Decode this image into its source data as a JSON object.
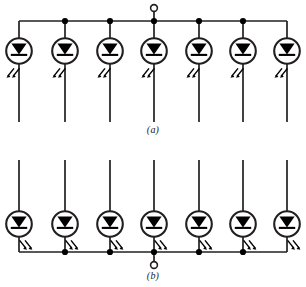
{
  "figure": {
    "width": 306,
    "height": 287,
    "background_color": "#ffffff",
    "line_color": "#231f20",
    "fill_color": "#000000"
  },
  "captions": {
    "a": "(a)",
    "b": "(b)"
  },
  "panels": [
    {
      "id": "a",
      "name": "common-anode-array",
      "caption": "(a)",
      "bus_position": "top",
      "bus_y": 21,
      "terminal": {
        "type": "open-circle",
        "x": 154,
        "y": 8,
        "radius": 3.4
      },
      "terminal_label": "",
      "led_count": 7,
      "led_center_y": 51,
      "led_radius": 13,
      "column_x": [
        19,
        65,
        110,
        154,
        199,
        243,
        287
      ],
      "junction_dot_columns": [
        65,
        110,
        154,
        199,
        243
      ],
      "lead_end_y": 122,
      "emission_side": "left",
      "emission_direction": "down-left"
    },
    {
      "id": "b",
      "name": "common-cathode-array",
      "caption": "(b)",
      "bus_position": "bottom",
      "bus_y": 252,
      "terminal": {
        "type": "open-circle",
        "x": 154,
        "y": 265,
        "radius": 3.4
      },
      "terminal_label": "",
      "led_count": 7,
      "led_center_y": 224,
      "led_radius": 13,
      "column_x": [
        19,
        65,
        110,
        154,
        199,
        243,
        287
      ],
      "junction_dot_columns": [
        65,
        110,
        154,
        199,
        243
      ],
      "lead_end_y": 160,
      "emission_side": "right",
      "emission_direction": "down-right"
    }
  ],
  "symbols": {
    "led": {
      "name": "light-emitting-diode",
      "shape": "circle-with-filled-triangle-and-cathode-bar",
      "triangle_direction": "down"
    },
    "junction": {
      "name": "junction-dot",
      "radius": 3.1
    },
    "terminal": {
      "name": "open-terminal",
      "radius": 3.4
    },
    "emission": {
      "name": "light-emission-arrows",
      "arrow_count": 2
    }
  }
}
